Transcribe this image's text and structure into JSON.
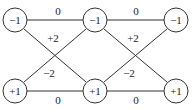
{
  "diagram": {
    "nodes": [
      {
        "id": "n1",
        "label": "−1",
        "x": 15,
        "y": 20
      },
      {
        "id": "n2",
        "label": "−1",
        "x": 95,
        "y": 20
      },
      {
        "id": "n3",
        "label": "−1",
        "x": 176,
        "y": 20
      },
      {
        "id": "n4",
        "label": "+1",
        "x": 15,
        "y": 91
      },
      {
        "id": "n5",
        "label": "+1",
        "x": 95,
        "y": 91
      },
      {
        "id": "n6",
        "label": "+1",
        "x": 176,
        "y": 91
      }
    ],
    "edge_labels": {
      "top_left": "0",
      "top_right": "0",
      "bottom_left": "0",
      "bottom_right": "0",
      "cross_left_down": "+2",
      "cross_left_up": "−2",
      "cross_right_down": "+2",
      "cross_right_up": "−2"
    }
  }
}
